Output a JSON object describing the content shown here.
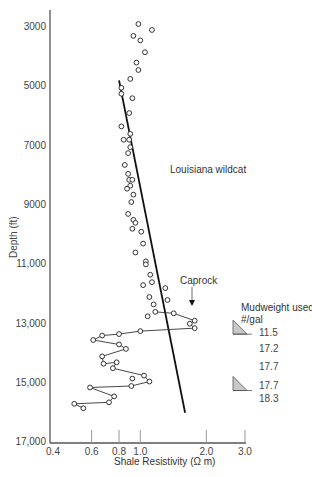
{
  "chart_data": {
    "type": "scatter",
    "title": "",
    "xlabel": "Shale Resistivity (Ω m)",
    "ylabel": "Depth (ft)",
    "xscale": "log",
    "xlim": [
      0.4,
      3.0
    ],
    "ylim": [
      17000,
      2500
    ],
    "y_inverted": true,
    "x_ticks": [
      "0.4",
      "0.6",
      "0.8",
      "1.0",
      "2.0",
      "3.0"
    ],
    "x_tick_values": [
      0.4,
      0.6,
      0.8,
      1.0,
      2.0,
      3.0
    ],
    "y_ticks": [
      "3000",
      "5000",
      "7000",
      "9000",
      "11,000",
      "13,000",
      "15,000",
      "17,000"
    ],
    "y_tick_values": [
      3000,
      5000,
      7000,
      9000,
      11000,
      13000,
      15000,
      17000
    ],
    "grid": false,
    "legend": null,
    "series": [
      {
        "name": "Shale resistivity (normal pressure)",
        "style": "open-circle",
        "points": [
          {
            "r": 0.98,
            "d": 2900
          },
          {
            "r": 1.13,
            "d": 3100
          },
          {
            "r": 0.93,
            "d": 3300
          },
          {
            "r": 1.0,
            "d": 3450
          },
          {
            "r": 1.05,
            "d": 3850
          },
          {
            "r": 0.96,
            "d": 4200
          },
          {
            "r": 0.98,
            "d": 4450
          },
          {
            "r": 0.9,
            "d": 4750
          },
          {
            "r": 0.82,
            "d": 5050
          },
          {
            "r": 0.82,
            "d": 5250
          },
          {
            "r": 0.92,
            "d": 5400
          },
          {
            "r": 0.89,
            "d": 5900
          },
          {
            "r": 0.82,
            "d": 6350
          },
          {
            "r": 0.9,
            "d": 6600
          },
          {
            "r": 0.84,
            "d": 6800
          },
          {
            "r": 0.89,
            "d": 6800
          },
          {
            "r": 0.9,
            "d": 7050
          },
          {
            "r": 0.88,
            "d": 7250
          },
          {
            "r": 0.85,
            "d": 7650
          },
          {
            "r": 0.88,
            "d": 7950
          },
          {
            "r": 0.89,
            "d": 8150
          },
          {
            "r": 0.92,
            "d": 8150
          },
          {
            "r": 0.9,
            "d": 8350
          },
          {
            "r": 0.87,
            "d": 8450
          },
          {
            "r": 0.93,
            "d": 8650
          },
          {
            "r": 0.91,
            "d": 8900
          },
          {
            "r": 0.88,
            "d": 9300
          },
          {
            "r": 0.93,
            "d": 9500
          },
          {
            "r": 0.95,
            "d": 9600
          },
          {
            "r": 0.92,
            "d": 9800
          },
          {
            "r": 1.01,
            "d": 9900
          },
          {
            "r": 1.03,
            "d": 10300
          },
          {
            "r": 0.95,
            "d": 10600
          },
          {
            "r": 1.06,
            "d": 10900
          },
          {
            "r": 1.06,
            "d": 11000
          },
          {
            "r": 1.11,
            "d": 11350
          },
          {
            "r": 1.13,
            "d": 11600
          },
          {
            "r": 1.03,
            "d": 11700
          },
          {
            "r": 1.1,
            "d": 12100
          },
          {
            "r": 1.33,
            "d": 12200
          },
          {
            "r": 1.15,
            "d": 12350
          },
          {
            "r": 1.08,
            "d": 12750
          }
        ]
      },
      {
        "name": "Shale resistivity (overpressured zone, connected)",
        "style": "open-circle-line",
        "points": [
          {
            "r": 1.17,
            "d": 12600
          },
          {
            "r": 1.42,
            "d": 12650
          },
          {
            "r": 1.77,
            "d": 12900
          },
          {
            "r": 1.68,
            "d": 13000
          },
          {
            "r": 1.77,
            "d": 13150
          },
          {
            "r": 1.0,
            "d": 13250
          },
          {
            "r": 0.8,
            "d": 13350
          },
          {
            "r": 0.67,
            "d": 13400
          },
          {
            "r": 0.61,
            "d": 13550
          },
          {
            "r": 0.8,
            "d": 13700
          },
          {
            "r": 0.86,
            "d": 13850
          },
          {
            "r": 0.67,
            "d": 14100
          },
          {
            "r": 0.68,
            "d": 14350
          },
          {
            "r": 0.78,
            "d": 14300
          },
          {
            "r": 0.75,
            "d": 14500
          },
          {
            "r": 1.04,
            "d": 14750
          },
          {
            "r": 1.1,
            "d": 14950
          },
          {
            "r": 0.91,
            "d": 15100
          },
          {
            "r": 0.59,
            "d": 15150
          },
          {
            "r": 0.76,
            "d": 15450
          },
          {
            "r": 0.72,
            "d": 15650
          },
          {
            "r": 0.5,
            "d": 15700
          },
          {
            "r": 0.55,
            "d": 15850
          }
        ],
        "isolated_points": [
          {
            "r": 0.92,
            "d": 14850
          },
          {
            "r": 1.3,
            "d": 11800
          }
        ]
      }
    ],
    "trend_line": {
      "name": "Normal compaction trend",
      "from": {
        "r": 0.8,
        "d": 4800
      },
      "to": {
        "r": 1.6,
        "d": 16000
      }
    },
    "annotations": [
      {
        "text": "Louisiana wildcat",
        "r": 1.2,
        "d": 8000
      },
      {
        "text": "Caprock",
        "r": 1.6,
        "d": 12000,
        "arrow_to": {
          "r": 1.7,
          "d": 12500
        }
      }
    ],
    "mudweight": {
      "title_line1": "Mudweight used",
      "title_line2": "#/gal",
      "values": [
        "11.5",
        "17.2",
        "17.7",
        "17.7",
        "18.3"
      ],
      "value_depths": [
        13300,
        13850,
        14450,
        15100,
        15550
      ],
      "markers_at_depths": [
        13150,
        15050
      ]
    }
  },
  "labels": {
    "ylabel": "Depth (ft)",
    "xlabel": "Shale Resistivity (Ω m)",
    "annotation_wildcat": "Louisiana wildcat",
    "annotation_caprock": "Caprock",
    "mudweight_title_1": "Mudweight used",
    "mudweight_title_2": "#/gal"
  },
  "colors": {
    "axis": "#555555",
    "trend_line": "#111111",
    "marker": "#333333",
    "mud_triangle_fill": "#c8c8c8"
  }
}
